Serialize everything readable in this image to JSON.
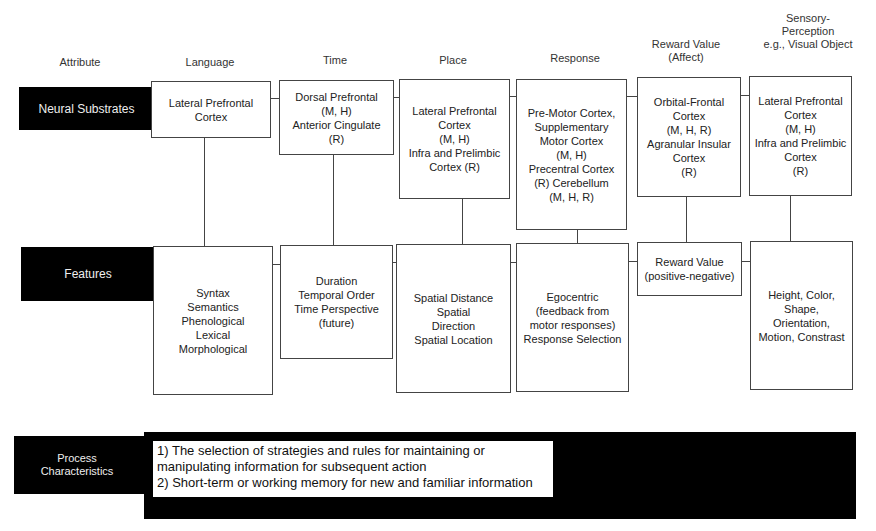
{
  "header": {
    "attribute_label": "Attribute",
    "columns": [
      {
        "key": "language",
        "label": "Language"
      },
      {
        "key": "time",
        "label": "Time"
      },
      {
        "key": "place",
        "label": "Place"
      },
      {
        "key": "response",
        "label": "Response"
      },
      {
        "key": "reward",
        "label": "Reward Value\n(Affect)"
      },
      {
        "key": "sensory",
        "label": "Sensory-\nPerception\ne.g., Visual Object"
      }
    ]
  },
  "rows": {
    "neural_substrates": {
      "label": "Neural Substrates",
      "cells": [
        "Lateral Prefrontal\nCortex",
        "Dorsal Prefrontal\n(M, H)\nAnterior Cingulate\n(R)",
        "Lateral Prefrontal\nCortex\n(M, H)\nInfra and Prelimbic\nCortex (R)",
        "Pre-Motor Cortex,\nSupplementary\nMotor Cortex\n(M, H)\nPrecentral Cortex\n(R)  Cerebellum\n(M, H, R)",
        "Orbital-Frontal\nCortex\n(M, H, R)\nAgranular Insular\nCortex\n(R)",
        "Lateral Prefrontal\nCortex\n(M, H)\nInfra and Prelimbic\nCortex\n(R)"
      ]
    },
    "features": {
      "label": "Features",
      "cells": [
        "Syntax\nSemantics\nPhenological\nLexical\nMorphological",
        "Duration\nTemporal Order\nTime Perspective\n(future)",
        "Spatial Distance\nSpatial\nDirection\nSpatial Location",
        "Egocentric\n(feedback from\nmotor responses)\nResponse Selection",
        "Reward Value\n(positive-negative)",
        "Height, Color,\nShape,\nOrientation,\nMotion, Constrast"
      ]
    },
    "process_characteristics": {
      "label": "Process\nCharacteristics",
      "lines": [
        "1) The selection of strategies and rules for maintaining or",
        "manipulating information for subsequent action",
        "2)  Short-term or working memory for new and familiar information"
      ]
    }
  },
  "colors": {
    "label_bg": "#000000",
    "label_text": "#eeeeee",
    "box_border": "#444444"
  }
}
